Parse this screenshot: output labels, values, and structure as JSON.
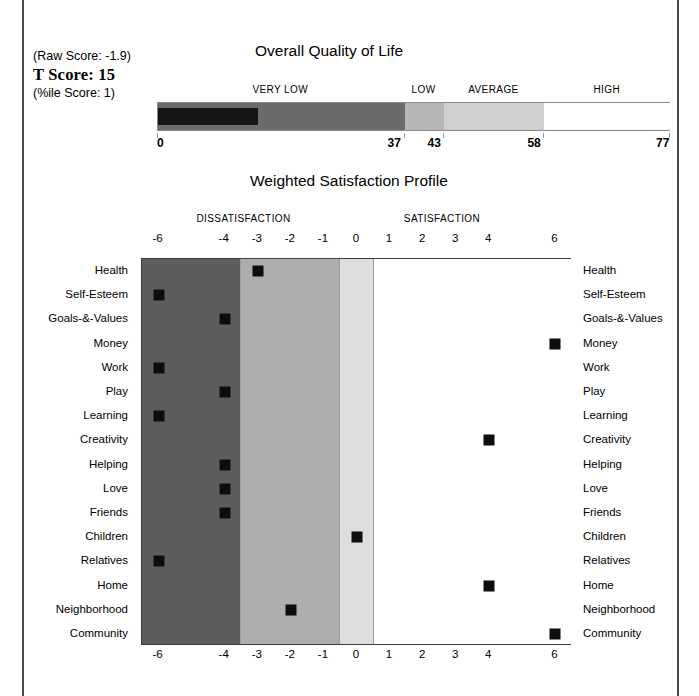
{
  "scores": {
    "raw_label": "(Raw Score:  -1.9)",
    "t_label": "T Score: 15",
    "pct_label": "(%ile Score: 1)"
  },
  "qol": {
    "title": "Overall Quality of Life",
    "bands": [
      {
        "label": "VERY LOW",
        "start": 0,
        "end": 37,
        "color": "#6b6b6b"
      },
      {
        "label": "LOW",
        "start": 37,
        "end": 43,
        "color": "#b6b6b6"
      },
      {
        "label": "AVERAGE",
        "start": 43,
        "end": 58,
        "color": "#cfcfcf"
      },
      {
        "label": "HIGH",
        "start": 58,
        "end": 77,
        "color": "#ffffff"
      }
    ],
    "axis_min": 0,
    "axis_max": 77,
    "ticks": [
      "0",
      "37",
      "43",
      "58",
      "77"
    ],
    "tick_values": [
      0,
      37,
      43,
      58,
      77
    ],
    "fill_value": 15,
    "fill_color": "#161616"
  },
  "profile": {
    "title": "Weighted Satisfaction Profile",
    "group_labels": [
      {
        "text": "DISSATISFACTION",
        "center": -3.4
      },
      {
        "text": "SATISFACTION",
        "center": 2.6
      }
    ],
    "axis_ticks": [
      "-6",
      "-4",
      "-3",
      "-2",
      "-1",
      "0",
      "1",
      "2",
      "3",
      "4",
      "6"
    ],
    "axis_tick_values": [
      -6,
      -4,
      -3,
      -2,
      -1,
      0,
      1,
      2,
      3,
      4,
      6
    ],
    "bands": [
      {
        "name": "severe",
        "start": -6.5,
        "end": -3.5,
        "color": "#5d5d5d"
      },
      {
        "name": "moderate",
        "start": -3.5,
        "end": -0.5,
        "color": "#aeaeae"
      },
      {
        "name": "mild",
        "start": -0.5,
        "end": 0.5,
        "color": "#dddddd"
      },
      {
        "name": "satisfied",
        "start": 0.5,
        "end": 6.5,
        "color": "#ffffff"
      }
    ],
    "rows": [
      {
        "label": "Health",
        "value": -3
      },
      {
        "label": "Self-Esteem",
        "value": -6
      },
      {
        "label": "Goals-&-Values",
        "value": -4
      },
      {
        "label": "Money",
        "value": 6
      },
      {
        "label": "Work",
        "value": -6
      },
      {
        "label": "Play",
        "value": -4
      },
      {
        "label": "Learning",
        "value": -6
      },
      {
        "label": "Creativity",
        "value": 4
      },
      {
        "label": "Helping",
        "value": -4
      },
      {
        "label": "Love",
        "value": -4
      },
      {
        "label": "Friends",
        "value": -4
      },
      {
        "label": "Children",
        "value": 0
      },
      {
        "label": "Relatives",
        "value": -6
      },
      {
        "label": "Home",
        "value": 4
      },
      {
        "label": "Neighborhood",
        "value": -2
      },
      {
        "label": "Community",
        "value": 6
      }
    ]
  },
  "chart_data": {
    "type": "bar",
    "charts": [
      {
        "type": "bar",
        "title": "Overall Quality of Life",
        "xlabel": "",
        "ylabel": "",
        "xlim": [
          0,
          77
        ],
        "grid": false,
        "categories": [
          "Overall Quality of Life"
        ],
        "values": [
          15
        ],
        "annotations": [
          "Raw Score: -1.9",
          "T Score: 15",
          "%ile Score: 1"
        ],
        "tick_labels": [
          "0",
          "37",
          "43",
          "58",
          "77"
        ],
        "bands": [
          {
            "label": "VERY LOW",
            "range": [
              0,
              37
            ]
          },
          {
            "label": "LOW",
            "range": [
              37,
              43
            ]
          },
          {
            "label": "AVERAGE",
            "range": [
              43,
              58
            ]
          },
          {
            "label": "HIGH",
            "range": [
              58,
              77
            ]
          }
        ]
      },
      {
        "type": "scatter",
        "title": "Weighted Satisfaction Profile",
        "xlabel": "",
        "ylabel": "",
        "xlim": [
          -6.5,
          6.5
        ],
        "grid": false,
        "legend": "none",
        "tick_labels": [
          "-6",
          "-4",
          "-3",
          "-2",
          "-1",
          "0",
          "1",
          "2",
          "3",
          "4",
          "6"
        ],
        "group_labels": [
          "DISSATISFACTION",
          "SATISFACTION"
        ],
        "categories": [
          "Health",
          "Self-Esteem",
          "Goals-&-Values",
          "Money",
          "Work",
          "Play",
          "Learning",
          "Creativity",
          "Helping",
          "Love",
          "Friends",
          "Children",
          "Relatives",
          "Home",
          "Neighborhood",
          "Community"
        ],
        "values": [
          -3,
          -6,
          -4,
          6,
          -6,
          -4,
          -6,
          4,
          -4,
          -4,
          -4,
          0,
          -6,
          4,
          -2,
          6
        ]
      }
    ]
  }
}
